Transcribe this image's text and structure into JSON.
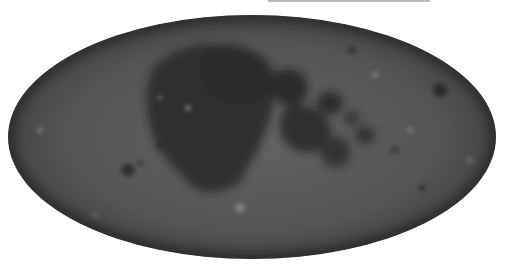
{
  "map": {
    "title": "",
    "projection": "Mollweide",
    "body": "Moon",
    "colors": {
      "background": "#ffffff",
      "highlands": "#5a5a5a",
      "highlands_light": "#7a7a7a",
      "maria": "#161616",
      "maria_mid": "#262626",
      "top_bar": "#b8b8b8"
    },
    "features": [
      {
        "name": "oceanus-procellarum",
        "type": "mare"
      },
      {
        "name": "mare-imbrium",
        "type": "mare"
      },
      {
        "name": "mare-serenitatis",
        "type": "mare"
      },
      {
        "name": "mare-tranquillitatis",
        "type": "mare"
      },
      {
        "name": "mare-crisium",
        "type": "mare"
      },
      {
        "name": "mare-nubium",
        "type": "mare"
      },
      {
        "name": "mare-fecunditatis",
        "type": "mare"
      },
      {
        "name": "mare-moscoviense",
        "type": "mare"
      },
      {
        "name": "mare-orientale",
        "type": "mare"
      },
      {
        "name": "tycho-crater",
        "type": "crater"
      }
    ]
  }
}
